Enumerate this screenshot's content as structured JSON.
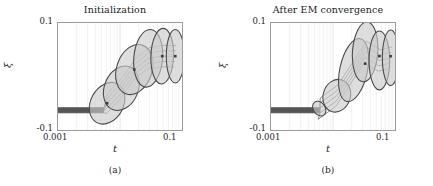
{
  "figure": {
    "panels": [
      {
        "id": "a",
        "title": "Initialization",
        "subcaption": "(a)",
        "xlabel": "t",
        "ylabel": "ξ",
        "xticks": [
          "0.001",
          "0.1"
        ],
        "yticks": [
          "0.1",
          "-0.1"
        ]
      },
      {
        "id": "b",
        "title": "After EM convergence",
        "subcaption": "(b)",
        "xlabel": "t",
        "ylabel": "ξ",
        "xticks": [
          "0.001",
          "0.1"
        ],
        "yticks": [
          "0.1",
          "-0.1"
        ]
      }
    ]
  },
  "chart_data": [
    {
      "type": "scatter",
      "title": "Initialization",
      "subcaption": "(a)",
      "xlabel": "t",
      "ylabel": "ξ",
      "xscale": "log",
      "xlim": [
        0.001,
        0.1
      ],
      "ylim": [
        -0.1,
        0.1
      ],
      "xtick_labels": [
        "0.001",
        "0.1"
      ],
      "ytick_labels": [
        "-0.1",
        "0.1"
      ],
      "grid": true,
      "grid_axis": "x",
      "legend": "none",
      "annotations": [],
      "baseline": {
        "description": "flat low-ξ trajectory bundle at left",
        "y": -0.063,
        "x_from": 0.001,
        "x_to": 0.0055
      },
      "components": [
        {
          "name": "component-1",
          "cx": 0.0062,
          "cy": -0.05,
          "width": 0.03,
          "height": 0.082,
          "angle_deg": -62
        },
        {
          "name": "component-2",
          "cx": 0.0105,
          "cy": -0.022,
          "width": 0.03,
          "height": 0.086,
          "angle_deg": -68
        },
        {
          "name": "component-3",
          "cx": 0.017,
          "cy": 0.013,
          "width": 0.03,
          "height": 0.096,
          "angle_deg": -72
        },
        {
          "name": "component-4",
          "cx": 0.0285,
          "cy": 0.034,
          "width": 0.032,
          "height": 0.108,
          "angle_deg": -85
        },
        {
          "name": "component-5",
          "cx": 0.048,
          "cy": 0.038,
          "width": 0.032,
          "height": 0.104,
          "angle_deg": -88
        },
        {
          "name": "component-6",
          "cx": 0.078,
          "cy": 0.038,
          "width": 0.03,
          "height": 0.1,
          "angle_deg": -90
        }
      ],
      "mean_markers": [
        {
          "x": 0.0062,
          "y": -0.05
        },
        {
          "x": 0.017,
          "y": 0.013
        },
        {
          "x": 0.048,
          "y": 0.038
        },
        {
          "x": 0.078,
          "y": 0.038
        }
      ]
    },
    {
      "type": "scatter",
      "title": "After EM convergence",
      "subcaption": "(b)",
      "xlabel": "t",
      "ylabel": "ξ",
      "xscale": "log",
      "xlim": [
        0.001,
        0.1
      ],
      "ylim": [
        -0.1,
        0.1
      ],
      "xtick_labels": [
        "0.001",
        "0.1"
      ],
      "ytick_labels": [
        "-0.1",
        "0.1"
      ],
      "grid": true,
      "grid_axis": "x",
      "legend": "none",
      "annotations": [],
      "baseline": {
        "description": "flat low-ξ trajectory bundle at left",
        "y": -0.063,
        "x_from": 0.001,
        "x_to": 0.0062
      },
      "components": [
        {
          "name": "component-1",
          "cx": 0.006,
          "cy": -0.06,
          "width": 0.012,
          "height": 0.018,
          "angle_deg": -35
        },
        {
          "name": "component-2",
          "cx": 0.0115,
          "cy": -0.036,
          "width": 0.016,
          "height": 0.062,
          "angle_deg": -72
        },
        {
          "name": "component-3",
          "cx": 0.0215,
          "cy": 0.012,
          "width": 0.022,
          "height": 0.12,
          "angle_deg": -78
        },
        {
          "name": "component-4",
          "cx": 0.033,
          "cy": 0.046,
          "width": 0.028,
          "height": 0.112,
          "angle_deg": -86
        },
        {
          "name": "component-5",
          "cx": 0.056,
          "cy": 0.03,
          "width": 0.03,
          "height": 0.11,
          "angle_deg": -90
        },
        {
          "name": "component-6",
          "cx": 0.085,
          "cy": 0.035,
          "width": 0.026,
          "height": 0.104,
          "angle_deg": -90
        }
      ],
      "mean_markers": [
        {
          "x": 0.033,
          "y": 0.024
        },
        {
          "x": 0.056,
          "y": 0.038
        },
        {
          "x": 0.085,
          "y": 0.038
        }
      ]
    }
  ],
  "colors": {
    "ellipse_fill": "#c9c9c9",
    "ellipse_stroke": "#4a4a4a",
    "grid": "#e2e2e2",
    "axis": "#9a9a9a",
    "text": "#1d1d1d",
    "baseline": "#2a2a2a"
  }
}
